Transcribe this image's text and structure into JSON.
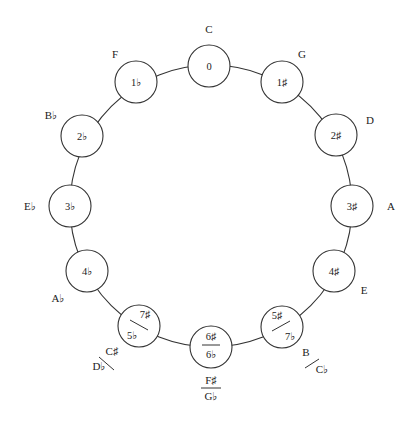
{
  "diagram": {
    "center": [
      211,
      206
    ],
    "radius": 141,
    "node_radius": 21,
    "stroke_color": "#333333",
    "background": "#ffffff"
  },
  "nodes": [
    {
      "id": "c",
      "angle": 0,
      "signature": "0",
      "key": "C",
      "type": "single"
    },
    {
      "id": "g",
      "angle": 30,
      "signature": "1♯",
      "key": "G",
      "type": "single"
    },
    {
      "id": "d",
      "angle": 60,
      "signature": "2♯",
      "key": "D",
      "type": "single"
    },
    {
      "id": "a",
      "angle": 90,
      "signature": "3♯",
      "key": "A",
      "type": "single"
    },
    {
      "id": "e",
      "angle": 120,
      "signature": "4♯",
      "key": "E",
      "type": "single"
    },
    {
      "id": "b",
      "angle": 150,
      "type": "diag-enharmonic",
      "signature_top": "5♯",
      "signature_bottom": "7♭",
      "key_top": "B",
      "key_bottom": "C♭"
    },
    {
      "id": "fs",
      "angle": 180,
      "type": "fraction-enharmonic",
      "signature_top": "6♯",
      "signature_bottom": "6♭",
      "key_top": "F♯",
      "key_bottom": "G♭"
    },
    {
      "id": "db",
      "angle": 210,
      "type": "diag-enharmonic-left",
      "signature_top": "7♯",
      "signature_bottom": "5♭",
      "key_top": "C♯",
      "key_bottom": "D♭"
    },
    {
      "id": "ab",
      "angle": 240,
      "signature": "4♭",
      "key": "A♭",
      "type": "single"
    },
    {
      "id": "eb",
      "angle": 270,
      "signature": "3♭",
      "key": "E♭",
      "type": "single"
    },
    {
      "id": "bb",
      "angle": 300,
      "signature": "2♭",
      "key": "B♭",
      "type": "single"
    },
    {
      "id": "f",
      "angle": 330,
      "signature": "1♭",
      "key": "F",
      "type": "single"
    }
  ]
}
